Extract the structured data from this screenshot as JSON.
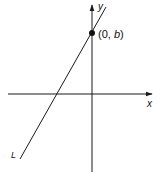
{
  "diagram": {
    "axes": {
      "x_label": "x",
      "y_label": "y"
    },
    "line": {
      "label": "L"
    },
    "point": {
      "label_open": "(0, ",
      "label_var": "b",
      "label_close": ")"
    },
    "colors": {
      "stroke": "#1a1a1a",
      "background": "#ffffff"
    }
  }
}
